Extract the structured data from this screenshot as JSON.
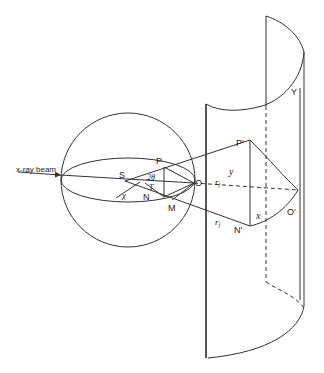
{
  "figure": {
    "labels": {
      "beam": "x-ray beam",
      "S": "S",
      "P": "P",
      "N": "N",
      "M": "M",
      "O": "O",
      "two_theta": "2θ",
      "tau": "T",
      "chi": "χ",
      "P_prime": "P′",
      "N_prime": "N′",
      "O_prime": "O′",
      "Y": "Y",
      "y": "y",
      "x": "x",
      "r_f_upper": "r",
      "r_f_upper_sub": "f",
      "r_f_lower": "r",
      "r_f_lower_sub": "f"
    },
    "colors": {
      "line": "#333333",
      "background": "#ffffff"
    }
  }
}
